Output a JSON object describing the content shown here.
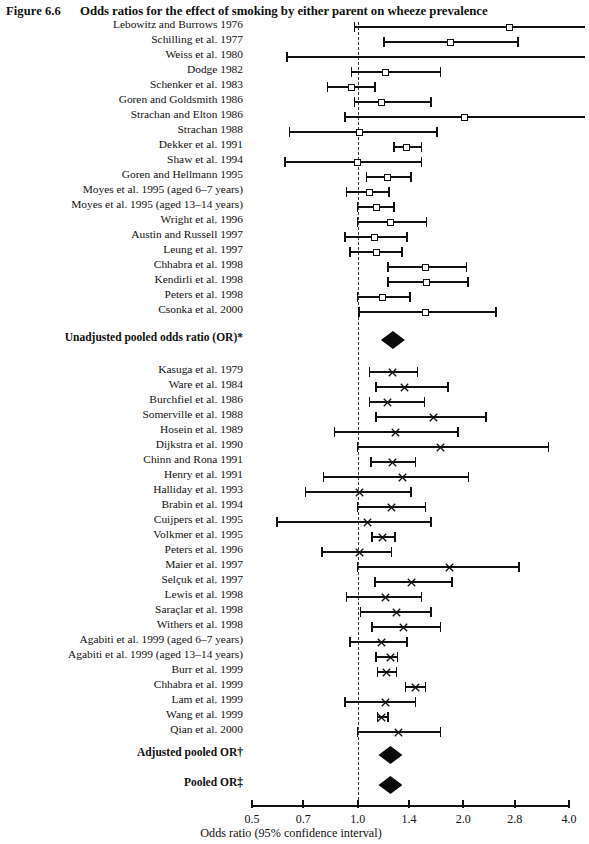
{
  "figure": {
    "number": "Figure 6.6",
    "title": "Odds ratios for the effect of smoking by either parent on wheeze prevalence"
  },
  "axis": {
    "caption": "Odds ratio (95% confidence interval)",
    "scale": "log",
    "ticks": [
      "0.5",
      "0.7",
      "1.0",
      "1.4",
      "2.0",
      "2.8",
      "4.0"
    ],
    "reference_line": "1.0"
  },
  "chart_data": {
    "type": "forest",
    "title": "Odds ratios for the effect of smoking by either parent on wheeze prevalence",
    "xlabel": "Odds ratio (95% confidence interval)",
    "ylabel": "",
    "xscale": "log",
    "xlim": [
      0.5,
      4.0
    ],
    "xticks": [
      0.5,
      0.7,
      1.0,
      1.4,
      2.0,
      2.8,
      4.0
    ],
    "reference_line": 1.0,
    "grid": false,
    "legend": "none",
    "sections": [
      {
        "name": "Unadjusted studies",
        "marker": "open-square",
        "rows": [
          {
            "label": "Lebowitz and Burrows 1976",
            "or": 2.7,
            "lo": 0.98,
            "hi": 4.4,
            "hi_clipped": true
          },
          {
            "label": "Schilling et al. 1977",
            "or": 1.84,
            "lo": 1.19,
            "hi": 2.86
          },
          {
            "label": "Weiss et al. 1980",
            "or": 1.4,
            "lo": 0.63,
            "hi": 4.4,
            "hi_clipped": true
          },
          {
            "label": "Dodge 1982",
            "or": 1.2,
            "lo": 0.96,
            "hi": 1.72
          },
          {
            "label": "Schenker et al. 1983",
            "or": 0.96,
            "lo": 0.82,
            "hi": 1.12
          },
          {
            "label": "Goren and Goldsmith 1986",
            "or": 1.17,
            "lo": 0.98,
            "hi": 1.62
          },
          {
            "label": "Strachan and Elton 1986",
            "or": 2.02,
            "lo": 0.92,
            "hi": 4.4,
            "hi_clipped": true
          },
          {
            "label": "Strachan 1988",
            "or": 1.01,
            "lo": 0.64,
            "hi": 1.68
          },
          {
            "label": "Dekker et al. 1991",
            "or": 1.38,
            "lo": 1.27,
            "hi": 1.52
          },
          {
            "label": "Shaw et al. 1994",
            "or": 1.0,
            "lo": 0.62,
            "hi": 1.52
          },
          {
            "label": "Goren and Hellmann 1995",
            "or": 1.22,
            "lo": 1.06,
            "hi": 1.42
          },
          {
            "label": "Moyes et al. 1995 (aged 6–7 years)",
            "or": 1.08,
            "lo": 0.93,
            "hi": 1.23
          },
          {
            "label": "Moyes et al. 1995 (aged 13–14 years)",
            "or": 1.13,
            "lo": 1.0,
            "hi": 1.27
          },
          {
            "label": "Wright et al. 1996",
            "or": 1.24,
            "lo": 1.0,
            "hi": 1.57
          },
          {
            "label": "Austin and Russell 1997",
            "or": 1.12,
            "lo": 0.92,
            "hi": 1.38
          },
          {
            "label": "Leung et al. 1997",
            "or": 1.13,
            "lo": 0.95,
            "hi": 1.34
          },
          {
            "label": "Chhabra et al. 1998",
            "or": 1.56,
            "lo": 1.22,
            "hi": 2.04
          },
          {
            "label": "Kendirli et al. 1998",
            "or": 1.57,
            "lo": 1.22,
            "hi": 2.06
          },
          {
            "label": "Peters et al. 1998",
            "or": 1.18,
            "lo": 1.0,
            "hi": 1.41
          },
          {
            "label": "Csonka et al. 2000",
            "or": 1.56,
            "lo": 1.01,
            "hi": 2.48
          }
        ]
      },
      {
        "name": "Unadjusted pooled odds ratio (OR)*",
        "marker": "diamond",
        "rows": [
          {
            "label": "Unadjusted pooled odds ratio (OR)*",
            "or": 1.26,
            "lo": 1.21,
            "hi": 1.31,
            "pooled": true
          }
        ]
      },
      {
        "name": "Adjusted studies",
        "marker": "cross",
        "rows": [
          {
            "label": "Kasuga et al. 1979",
            "or": 1.26,
            "lo": 1.08,
            "hi": 1.48
          },
          {
            "label": "Ware et al. 1984",
            "or": 1.36,
            "lo": 1.13,
            "hi": 1.81
          },
          {
            "label": "Burchfiel et al. 1986",
            "or": 1.22,
            "lo": 0.85,
            "hi": 1.55
          },
          {
            "label": "Somerville et al. 1988",
            "or": 1.64,
            "lo": 1.0,
            "hi": 3.5
          },
          {
            "label": "Hosein et al. 1989",
            "or": 1.28,
            "lo": 1.09,
            "hi": 1.46
          },
          {
            "label": "Dijkstra et al. 1990",
            "or": 1.34,
            "lo": 0.8,
            "hi": 2.07
          },
          {
            "label": "Chinn and Rona 1991",
            "or": 1.01,
            "lo": 0.71,
            "hi": 1.42
          },
          {
            "label": "Henry et al. 1991",
            "or": 1.25,
            "lo": 1.0,
            "hi": 1.56
          },
          {
            "label": "Halliday et al. 1993",
            "or": 1.27,
            "lo": 1.0,
            "hi": 1.52
          },
          {
            "label": "Brabin et al. 1994",
            "or": 1.08,
            "lo": 0.66,
            "hi": 1.62
          },
          {
            "label": "Cuijpers et al. 1995",
            "or": 1.18,
            "lo": 1.1,
            "hi": 1.28
          },
          {
            "label": "Volkmer et al. 1995",
            "or": 1.01,
            "lo": 0.79,
            "hi": 1.25
          },
          {
            "label": "Peters et al. 1996",
            "or": 1.83,
            "lo": 1.0,
            "hi": 2.88
          },
          {
            "label": "Maier et al. 1997",
            "or": 1.42,
            "lo": 1.12,
            "hi": 1.86
          },
          {
            "label": "Selçuk et al. 1997",
            "or": 1.2,
            "lo": 0.9,
            "hi": 1.47
          },
          {
            "label": "Lewis et al. 1998",
            "or": 1.29,
            "lo": 1.01,
            "hi": 1.58
          },
          {
            "label": "Saraçlar et al. 1998",
            "or": 1.32,
            "lo": 1.12,
            "hi": 1.62
          },
          {
            "label": "Withers et al. 1998",
            "or": 1.17,
            "lo": 0.96,
            "hi": 1.38
          },
          {
            "label": "Agabiti et al. 1999 (aged 6–7 years)",
            "or": 1.24,
            "lo": 1.13,
            "hi": 1.3
          },
          {
            "label": "Agabiti et al. 1999 (aged 13–14 years)",
            "or": 1.46,
            "lo": 1.37,
            "hi": 1.56
          },
          {
            "label": "Burr et al. 1999",
            "or": 1.2,
            "lo": 0.92,
            "hi": 1.46
          },
          {
            "label": "Chhabra et al. 1999",
            "or": 1.17,
            "lo": 1.14,
            "hi": 1.22
          },
          {
            "label": "Lam et al. 1999",
            "or": 1.25,
            "lo": 0.99,
            "hi": 1.56
          },
          {
            "label": "Wang et al. 1999",
            "or": 1.24,
            "lo": 1.13,
            "hi": 1.33
          },
          {
            "label": "Qian et al. 2000",
            "or": 1.31,
            "lo": 1.06,
            "hi": 1.72
          }
        ]
      },
      {
        "name": "Adjusted pooled OR†",
        "marker": "diamond",
        "rows": [
          {
            "label": "Adjusted pooled OR†",
            "or": 1.24,
            "lo": 1.19,
            "hi": 1.29,
            "pooled": true
          }
        ]
      },
      {
        "name": "Pooled OR‡",
        "marker": "diamond",
        "rows": [
          {
            "label": "Pooled OR‡",
            "or": 1.24,
            "lo": 1.2,
            "hi": 1.28,
            "pooled": true
          }
        ]
      }
    ]
  },
  "rows": [
    {
      "label": "Lebowitz and Burrows 1976",
      "y": 27,
      "type": "box",
      "or": 2.7,
      "lo": 0.98,
      "hi": 4.45
    },
    {
      "label": "Schilling et al. 1977",
      "y": 42,
      "type": "box",
      "or": 1.84,
      "lo": 1.19,
      "hi": 2.86
    },
    {
      "label": "Weiss et al. 1980",
      "y": 57,
      "type": "none",
      "or": 1.4,
      "lo": 0.63,
      "hi": 4.45
    },
    {
      "label": "Dodge 1982",
      "y": 72,
      "type": "box",
      "or": 1.2,
      "lo": 0.96,
      "hi": 1.72
    },
    {
      "label": "Schenker et al. 1983",
      "y": 87,
      "type": "box",
      "or": 0.96,
      "lo": 0.82,
      "hi": 1.12
    },
    {
      "label": "Goren and Goldsmith 1986",
      "y": 102,
      "type": "box",
      "or": 1.17,
      "lo": 0.98,
      "hi": 1.62
    },
    {
      "label": "Strachan and Elton 1986",
      "y": 117,
      "type": "box",
      "or": 2.02,
      "lo": 0.92,
      "hi": 4.45
    },
    {
      "label": "Strachan 1988",
      "y": 132,
      "type": "box",
      "or": 1.01,
      "lo": 0.64,
      "hi": 1.68
    },
    {
      "label": "Dekker et al. 1991",
      "y": 147,
      "type": "box",
      "or": 1.38,
      "lo": 1.27,
      "hi": 1.52
    },
    {
      "label": "Shaw et al. 1994",
      "y": 162,
      "type": "box",
      "or": 1.0,
      "lo": 0.62,
      "hi": 1.52
    },
    {
      "label": "Goren and Hellmann 1995",
      "y": 177,
      "type": "box",
      "or": 1.22,
      "lo": 1.06,
      "hi": 1.42
    },
    {
      "label": "Moyes et al. 1995 (aged 6–7 years)",
      "y": 192,
      "type": "box",
      "or": 1.08,
      "lo": 0.93,
      "hi": 1.23
    },
    {
      "label": "Moyes et al. 1995 (aged 13–14 years)",
      "y": 207,
      "type": "box",
      "or": 1.13,
      "lo": 1.0,
      "hi": 1.27
    },
    {
      "label": "Wright et al. 1996",
      "y": 222,
      "type": "box",
      "or": 1.24,
      "lo": 1.0,
      "hi": 1.57
    },
    {
      "label": "Austin and Russell 1997",
      "y": 237,
      "type": "box",
      "or": 1.12,
      "lo": 0.92,
      "hi": 1.38
    },
    {
      "label": "Leung et al. 1997",
      "y": 252,
      "type": "box",
      "or": 1.13,
      "lo": 0.95,
      "hi": 1.34
    },
    {
      "label": "Chhabra et al. 1998",
      "y": 267,
      "type": "box",
      "or": 1.56,
      "lo": 1.22,
      "hi": 2.04
    },
    {
      "label": "Kendirli et al. 1998",
      "y": 282,
      "type": "box",
      "or": 1.57,
      "lo": 1.22,
      "hi": 2.06
    },
    {
      "label": "Peters et al. 1998",
      "y": 297,
      "type": "box",
      "or": 1.18,
      "lo": 1.0,
      "hi": 1.41
    },
    {
      "label": "Csonka et al. 2000",
      "y": 312,
      "type": "box",
      "or": 1.56,
      "lo": 1.01,
      "hi": 2.48
    },
    {
      "label": "Unadjusted pooled odds ratio (OR)*",
      "y": 340,
      "type": "diamond",
      "bold": true,
      "or": 1.26,
      "lo": 1.19,
      "hi": 1.33
    },
    {
      "label": "Kasuga et al. 1979",
      "y": 372,
      "type": "cross",
      "or": 1.26,
      "lo": 1.08,
      "hi": 1.48
    },
    {
      "label": "Ware et al. 1984",
      "y": 387,
      "type": "cross",
      "or": 1.36,
      "lo": 1.13,
      "hi": 1.81
    },
    {
      "label": "Burchfiel et al. 1986",
      "y": 402,
      "type": "cross",
      "or": 1.22,
      "lo": 1.08,
      "hi": 1.55
    },
    {
      "label": "Somerville et al. 1988",
      "y": 417,
      "type": "cross",
      "or": 1.64,
      "lo": 1.13,
      "hi": 2.32
    },
    {
      "label": "Hosein et al. 1989",
      "y": 432,
      "type": "cross",
      "or": 1.28,
      "lo": 0.86,
      "hi": 1.93
    },
    {
      "label": "Dijkstra et al. 1990",
      "y": 447,
      "type": "cross",
      "or": 1.72,
      "lo": 1.0,
      "hi": 3.5
    },
    {
      "label": "Chinn and Rona 1991",
      "y": 462,
      "type": "cross",
      "or": 1.26,
      "lo": 1.09,
      "hi": 1.46
    },
    {
      "label": "Henry et al. 1991",
      "y": 477,
      "type": "cross",
      "or": 1.34,
      "lo": 0.8,
      "hi": 2.07
    },
    {
      "label": "Halliday et al. 1993",
      "y": 492,
      "type": "cross",
      "or": 1.01,
      "lo": 0.71,
      "hi": 1.42
    },
    {
      "label": "Brabin et al. 1994",
      "y": 507,
      "type": "cross",
      "or": 1.25,
      "lo": 1.0,
      "hi": 1.56
    },
    {
      "label": "Cuijpers et al. 1995",
      "y": 522,
      "type": "cross",
      "or": 1.07,
      "lo": 0.59,
      "hi": 1.62
    },
    {
      "label": "Volkmer et al. 1995",
      "y": 537,
      "type": "cross",
      "or": 1.18,
      "lo": 1.1,
      "hi": 1.28
    },
    {
      "label": "Peters et al. 1996",
      "y": 552,
      "type": "cross",
      "or": 1.01,
      "lo": 0.79,
      "hi": 1.25
    },
    {
      "label": "Maier et al. 1997",
      "y": 567,
      "type": "cross",
      "or": 1.83,
      "lo": 1.0,
      "hi": 2.88
    },
    {
      "label": "Selçuk et al. 1997",
      "y": 582,
      "type": "cross",
      "or": 1.42,
      "lo": 1.12,
      "hi": 1.86
    },
    {
      "label": "Lewis et al. 1998",
      "y": 597,
      "type": "cross",
      "or": 1.2,
      "lo": 0.93,
      "hi": 1.52
    },
    {
      "label": "Saraçlar et al. 1998",
      "y": 612,
      "type": "cross",
      "or": 1.29,
      "lo": 1.02,
      "hi": 1.62
    },
    {
      "label": "Withers et al. 1998",
      "y": 627,
      "type": "cross",
      "or": 1.35,
      "lo": 1.1,
      "hi": 1.72
    },
    {
      "label": "Agabiti et al. 1999 (aged 6–7 years)",
      "y": 642,
      "type": "cross",
      "or": 1.17,
      "lo": 0.95,
      "hi": 1.38
    },
    {
      "label": "Agabiti et al. 1999 (aged 13–14 years)",
      "y": 657,
      "type": "cross",
      "or": 1.24,
      "lo": 1.13,
      "hi": 1.3
    },
    {
      "label": "Burr et al. 1999",
      "y": 672,
      "type": "cross",
      "or": 1.21,
      "lo": 1.14,
      "hi": 1.29
    },
    {
      "label": "Chhabra et al. 1999",
      "y": 687,
      "type": "cross",
      "or": 1.46,
      "lo": 1.37,
      "hi": 1.56
    },
    {
      "label": "Lam et al. 1999",
      "y": 702,
      "type": "cross",
      "or": 1.2,
      "lo": 0.92,
      "hi": 1.46
    },
    {
      "label": "Wang et al. 1999",
      "y": 717,
      "type": "cross",
      "or": 1.17,
      "lo": 1.14,
      "hi": 1.22
    },
    {
      "label": "Qian et al. 2000",
      "y": 732,
      "type": "cross",
      "or": 1.31,
      "lo": 1.0,
      "hi": 1.72
    },
    {
      "label": "Adjusted pooled OR†",
      "y": 755,
      "type": "diamond",
      "bold": true,
      "or": 1.24,
      "lo": 1.18,
      "hi": 1.3
    },
    {
      "label": "Pooled OR‡",
      "y": 785,
      "type": "diamond",
      "bold": true,
      "or": 1.24,
      "lo": 1.19,
      "hi": 1.29
    }
  ]
}
